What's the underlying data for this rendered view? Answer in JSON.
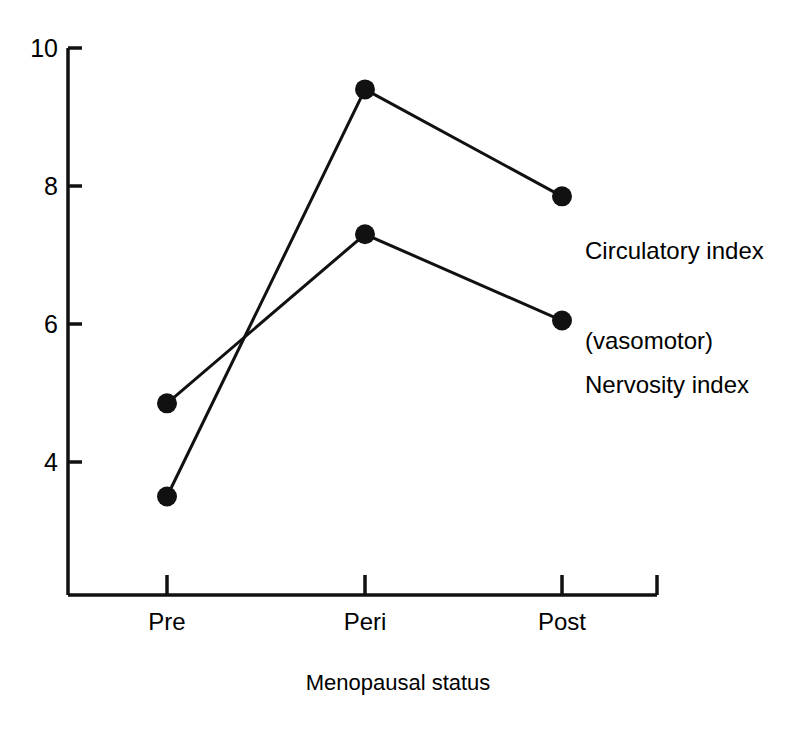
{
  "chart_data": {
    "type": "line",
    "title": "",
    "xlabel": "Menopausal status",
    "ylabel": "",
    "categories": [
      "Pre",
      "Peri",
      "Post"
    ],
    "ylim": [
      2.0,
      10.0
    ],
    "y_ticks": [
      4,
      6,
      8,
      10
    ],
    "y_tick_labels": [
      "4",
      "6",
      "8",
      "10"
    ],
    "grid": false,
    "legend_position": "right-inline",
    "marker": "filled-circle",
    "line_color": "#111111",
    "marker_color": "#111111",
    "background_color": "#ffffff",
    "series": [
      {
        "name": "Circulatory index (vasomotor)",
        "label_line1": "Circulatory index",
        "label_line2": "(vasomotor)",
        "values": [
          3.5,
          9.4,
          7.85
        ]
      },
      {
        "name": "Nervosity index",
        "label_line1": "Nervosity index",
        "label_line2": "",
        "values": [
          4.85,
          7.3,
          6.05
        ]
      }
    ]
  },
  "axis": {
    "y_tick_4": "4",
    "y_tick_6": "6",
    "y_tick_8": "8",
    "y_tick_10": "10",
    "x_tick_pre": "Pre",
    "x_tick_peri": "Peri",
    "x_tick_post": "Post",
    "x_title": "Menopausal status"
  },
  "legend": {
    "circulatory_line1": "Circulatory index",
    "circulatory_line2": "(vasomotor)",
    "nervosity_line1": "Nervosity index"
  }
}
